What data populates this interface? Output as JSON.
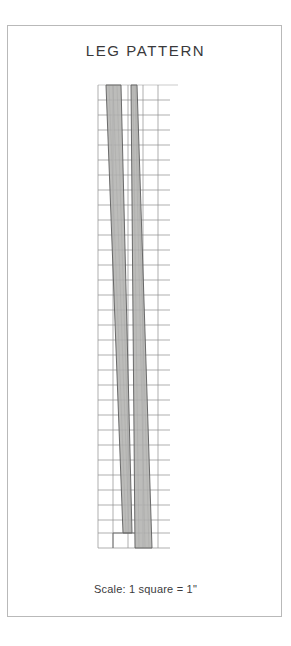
{
  "page": {
    "background_color": "#ffffff",
    "border_color": "#b9b9b9",
    "width": 291,
    "height": 646
  },
  "title": "LEG PATTERN",
  "caption": "Scale: 1 square = 1\"",
  "figure": {
    "name": "leg-pattern-drawing",
    "grid": {
      "line_color": "#8c8c8c",
      "minor_line_color": "#c9c9c9",
      "cell_size_px": 15,
      "columns": 4,
      "rows": 31,
      "left_px": 98,
      "top_px": 85,
      "right_px": 164,
      "bottom_px": 548,
      "unit_label": "1 square = 1\""
    },
    "shapes": [
      {
        "name": "leg-piece-left",
        "fill": "#b3b3b1",
        "stroke": "#5c5c5c",
        "top_left_x": 106,
        "top_right_x": 121,
        "bottom_left_x": 123,
        "bottom_right_x": 132,
        "top_y": 85,
        "bottom_y": 533
      },
      {
        "name": "leg-piece-right",
        "fill": "#b3b3b1",
        "stroke": "#5c5c5c",
        "top_left_x": 131,
        "top_right_x": 137,
        "bottom_left_x": 135,
        "bottom_right_x": 152,
        "top_y": 85,
        "bottom_y": 548
      }
    ]
  },
  "colors": {
    "shape_fill": "#b3b3b1",
    "shape_stroke": "#5c5c5c",
    "grid_line": "#8c8c8c",
    "text": "#39393b",
    "frame": "#b9b9b9"
  }
}
